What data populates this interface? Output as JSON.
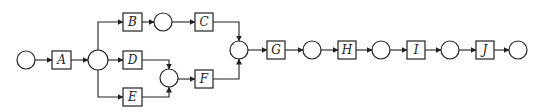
{
  "diagram": {
    "type": "network-flow",
    "activities": [
      {
        "id": "A",
        "label": "A"
      },
      {
        "id": "B",
        "label": "B"
      },
      {
        "id": "C",
        "label": "C"
      },
      {
        "id": "D",
        "label": "D"
      },
      {
        "id": "E",
        "label": "E"
      },
      {
        "id": "F",
        "label": "F"
      },
      {
        "id": "G",
        "label": "G"
      },
      {
        "id": "H",
        "label": "H"
      },
      {
        "id": "I",
        "label": "I"
      },
      {
        "id": "J",
        "label": "J"
      }
    ],
    "edges": [
      [
        "start",
        "A"
      ],
      [
        "A",
        "split"
      ],
      [
        "split",
        "B"
      ],
      [
        "B",
        "n3"
      ],
      [
        "n3",
        "C"
      ],
      [
        "C",
        "merge"
      ],
      [
        "split",
        "D"
      ],
      [
        "D",
        "n4"
      ],
      [
        "split",
        "E"
      ],
      [
        "E",
        "n4"
      ],
      [
        "n4",
        "F"
      ],
      [
        "F",
        "merge"
      ],
      [
        "merge",
        "G"
      ],
      [
        "G",
        "n6"
      ],
      [
        "n6",
        "H"
      ],
      [
        "H",
        "n7"
      ],
      [
        "n7",
        "I"
      ],
      [
        "I",
        "n8"
      ],
      [
        "n8",
        "J"
      ],
      [
        "J",
        "end"
      ]
    ]
  }
}
